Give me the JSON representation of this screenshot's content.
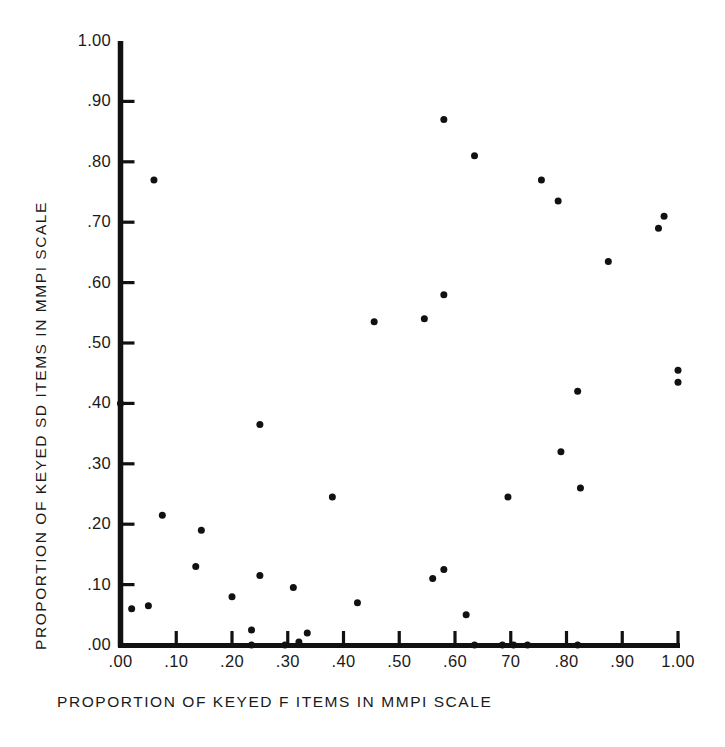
{
  "figure": {
    "background_color": "#ffffff",
    "ink_color": "#111111",
    "marker_color": "#111111"
  },
  "chart_data": {
    "type": "scatter",
    "title": "",
    "xlabel": "PROPORTION OF KEYED F ITEMS IN MMPI SCALE",
    "ylabel": "PROPORTION OF KEYED SD ITEMS IN MMPI SCALE",
    "xlim": [
      0.0,
      1.0
    ],
    "ylim": [
      0.0,
      1.0
    ],
    "grid": false,
    "legend": null,
    "xticks": [
      0.0,
      0.1,
      0.2,
      0.3,
      0.4,
      0.5,
      0.6,
      0.7,
      0.8,
      0.9,
      1.0
    ],
    "xticklabels": [
      ".00",
      ".10",
      ".20",
      ".30",
      ".40",
      ".50",
      ".60",
      "70",
      ".80",
      ".90",
      "1.00"
    ],
    "yticks": [
      0.0,
      0.1,
      0.2,
      0.3,
      0.4,
      0.5,
      0.6,
      0.7,
      0.8,
      0.9,
      1.0
    ],
    "yticklabels": [
      ".00",
      ".10",
      ".20",
      ".30",
      ".40",
      ".50",
      ".60",
      ".70",
      ".80",
      ".90",
      "1.00"
    ],
    "marker": "filled-circle",
    "marker_size_px": 7,
    "points": [
      {
        "x": 0.0,
        "y": 0.4
      },
      {
        "x": 0.06,
        "y": 0.77
      },
      {
        "x": 0.02,
        "y": 0.06
      },
      {
        "x": 0.05,
        "y": 0.065
      },
      {
        "x": 0.075,
        "y": 0.215
      },
      {
        "x": 0.135,
        "y": 0.13
      },
      {
        "x": 0.145,
        "y": 0.19
      },
      {
        "x": 0.2,
        "y": 0.08
      },
      {
        "x": 0.235,
        "y": 0.025
      },
      {
        "x": 0.25,
        "y": 0.365
      },
      {
        "x": 0.25,
        "y": 0.115
      },
      {
        "x": 0.235,
        "y": 0.0
      },
      {
        "x": 0.295,
        "y": 0.0
      },
      {
        "x": 0.31,
        "y": 0.095
      },
      {
        "x": 0.32,
        "y": 0.005
      },
      {
        "x": 0.335,
        "y": 0.02
      },
      {
        "x": 0.38,
        "y": 0.245
      },
      {
        "x": 0.425,
        "y": 0.07
      },
      {
        "x": 0.455,
        "y": 0.535
      },
      {
        "x": 0.545,
        "y": 0.54
      },
      {
        "x": 0.56,
        "y": 0.11
      },
      {
        "x": 0.58,
        "y": 0.87
      },
      {
        "x": 0.58,
        "y": 0.125
      },
      {
        "x": 0.58,
        "y": 0.58
      },
      {
        "x": 0.62,
        "y": 0.05
      },
      {
        "x": 0.635,
        "y": 0.0
      },
      {
        "x": 0.635,
        "y": 0.81
      },
      {
        "x": 0.685,
        "y": 0.0
      },
      {
        "x": 0.705,
        "y": 0.0
      },
      {
        "x": 0.695,
        "y": 0.245
      },
      {
        "x": 0.73,
        "y": 0.0
      },
      {
        "x": 0.755,
        "y": 0.77
      },
      {
        "x": 0.785,
        "y": 0.735
      },
      {
        "x": 0.79,
        "y": 0.32
      },
      {
        "x": 0.82,
        "y": 0.42
      },
      {
        "x": 0.825,
        "y": 0.26
      },
      {
        "x": 0.82,
        "y": 0.0
      },
      {
        "x": 0.875,
        "y": 0.635
      },
      {
        "x": 0.965,
        "y": 0.69
      },
      {
        "x": 0.975,
        "y": 0.71
      },
      {
        "x": 1.0,
        "y": 0.455
      },
      {
        "x": 1.0,
        "y": 0.435
      }
    ]
  }
}
